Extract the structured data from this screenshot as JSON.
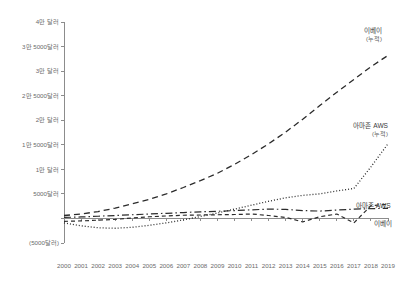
{
  "chart_data": {
    "type": "line",
    "title": "",
    "xlabel": "",
    "ylabel": "",
    "x": [
      2000,
      2001,
      2002,
      2003,
      2004,
      2005,
      2006,
      2007,
      2008,
      2009,
      2010,
      2011,
      2012,
      2013,
      2014,
      2015,
      2016,
      2017,
      2018,
      2019
    ],
    "x_tick_labels": [
      "2000",
      "2001",
      "2002",
      "2003",
      "2004",
      "2005",
      "2006",
      "2007",
      "2008",
      "2009",
      "2010",
      "2011",
      "2012",
      "2013",
      "2014",
      "2015",
      "2016",
      "2017",
      "2018",
      "2019"
    ],
    "y_tick_values": [
      40000,
      35000,
      30000,
      25000,
      20000,
      15000,
      10000,
      5000,
      0,
      -5000
    ],
    "y_tick_labels": [
      "4만 달러",
      "3만 5000달러",
      "3만 달러",
      "2만 5000달러",
      "2만 달러",
      "1만 5000달러",
      "1만 달러",
      "5000달러",
      "",
      "(5000달러)"
    ],
    "ylim": [
      -5000,
      40000
    ],
    "xlim": [
      2000,
      2019
    ],
    "grid": false,
    "legend_position": "inline-right",
    "series": [
      {
        "name": "이베이 (누적)",
        "label_line1": "이베이",
        "label_line2": "(누적)",
        "style": "dashed",
        "color": "#2b2b2b",
        "values": [
          600,
          900,
          1400,
          2100,
          3000,
          3900,
          5000,
          6300,
          7700,
          9200,
          11000,
          13000,
          15200,
          17600,
          20200,
          23000,
          25700,
          28300,
          30900,
          33200
        ]
      },
      {
        "name": "아마존 AWS (누적)",
        "label_line1": "아마존 AWS",
        "label_line2": "(누적)",
        "style": "dotted",
        "color": "#2b2b2b",
        "values": [
          -900,
          -1500,
          -1900,
          -2000,
          -1800,
          -1400,
          -900,
          -300,
          400,
          1100,
          1900,
          2700,
          3500,
          4200,
          4700,
          5000,
          5600,
          6100,
          10500,
          15200
        ]
      },
      {
        "name": "아마존 AWS",
        "label_line1": "아마존 AWS",
        "label_line2": "",
        "style": "dashed-small",
        "color": "#2b2b2b",
        "values": [
          -600,
          -500,
          -350,
          -200,
          100,
          350,
          500,
          650,
          700,
          750,
          800,
          900,
          600,
          200,
          -700,
          350,
          900,
          -900,
          2600,
          2900
        ]
      },
      {
        "name": "이베이",
        "label_line1": "이베이",
        "label_line2": "",
        "style": "dash-dot",
        "color": "#2b2b2b",
        "values": [
          200,
          300,
          450,
          600,
          750,
          900,
          1050,
          1200,
          1350,
          1450,
          1600,
          1750,
          1900,
          1850,
          1600,
          1500,
          1700,
          1900,
          2000,
          2050
        ]
      }
    ]
  },
  "axis": {
    "y_axis_name": "y-axis",
    "x_axis_name": "x-axis"
  }
}
